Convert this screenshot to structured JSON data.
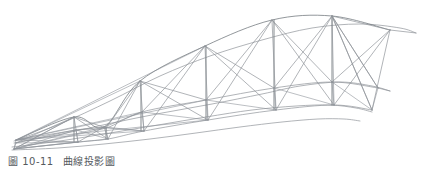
{
  "figure": {
    "caption_number": "圖 10-11",
    "caption_title": "曲線投影圖",
    "caption_full": "圖 10-11  曲線投影圖",
    "background_color": "#ffffff",
    "line_color": "#8f949a",
    "line_color_dark": "#6e747a",
    "caption_color": "#555a5e",
    "width": 424,
    "height": 170
  },
  "chart_data": {
    "type": "diagram",
    "title": "曲線投影圖",
    "subtitle": "",
    "xlabel": "",
    "ylabel": "",
    "grid": false,
    "legend": null,
    "xlim": [
      0,
      424
    ],
    "ylim": [
      0,
      170
    ],
    "curves": [
      {
        "name": "top-chord",
        "points": [
          [
            14,
            141
          ],
          [
            60,
            124
          ],
          [
            110,
            101
          ],
          [
            160,
            76
          ],
          [
            210,
            56
          ],
          [
            262,
            40
          ],
          [
            312,
            28
          ],
          [
            360,
            24
          ],
          [
            400,
            28
          ],
          [
            416,
            33
          ]
        ]
      },
      {
        "name": "middle-chord",
        "points": [
          [
            14,
            143
          ],
          [
            62,
            134
          ],
          [
            112,
            123
          ],
          [
            162,
            113
          ],
          [
            212,
            104
          ],
          [
            262,
            94
          ],
          [
            300,
            86
          ],
          [
            340,
            82
          ],
          [
            372,
            86
          ],
          [
            390,
            91
          ]
        ]
      },
      {
        "name": "lower-chord",
        "points": [
          [
            12,
            147
          ],
          [
            60,
            141
          ],
          [
            110,
            133
          ],
          [
            158,
            125
          ],
          [
            206,
            117
          ],
          [
            252,
            110
          ],
          [
            296,
            106
          ],
          [
            330,
            105
          ],
          [
            356,
            108
          ],
          [
            372,
            112
          ]
        ]
      },
      {
        "name": "bottom-chord",
        "points": [
          [
            12,
            150
          ],
          [
            58,
            148
          ],
          [
            104,
            144
          ],
          [
            150,
            139
          ],
          [
            196,
            133
          ],
          [
            240,
            127
          ],
          [
            282,
            122
          ],
          [
            318,
            119
          ],
          [
            344,
            119
          ],
          [
            360,
            121
          ]
        ]
      }
    ],
    "top_nodes": [
      {
        "id": "T0",
        "x": 16,
        "y": 140
      },
      {
        "id": "T1",
        "x": 74,
        "y": 117
      },
      {
        "id": "T2",
        "x": 104,
        "y": 127
      },
      {
        "id": "T3",
        "x": 140,
        "y": 81
      },
      {
        "id": "T4",
        "x": 205,
        "y": 46
      },
      {
        "id": "T5",
        "x": 272,
        "y": 20
      },
      {
        "id": "T6",
        "x": 332,
        "y": 16
      },
      {
        "id": "T7",
        "x": 390,
        "y": 30
      }
    ],
    "mid_nodes": [
      {
        "id": "M0",
        "x": 16,
        "y": 143
      },
      {
        "id": "M1",
        "x": 76,
        "y": 130
      },
      {
        "id": "M2",
        "x": 106,
        "y": 128
      },
      {
        "id": "M3",
        "x": 142,
        "y": 112
      },
      {
        "id": "M4",
        "x": 206,
        "y": 100
      },
      {
        "id": "M5",
        "x": 274,
        "y": 88
      },
      {
        "id": "M6",
        "x": 332,
        "y": 82
      },
      {
        "id": "M7",
        "x": 378,
        "y": 88
      }
    ],
    "bottom_nodes": [
      {
        "id": "B0",
        "x": 14,
        "y": 149
      },
      {
        "id": "B1",
        "x": 78,
        "y": 142
      },
      {
        "id": "B2",
        "x": 108,
        "y": 139
      },
      {
        "id": "B3",
        "x": 144,
        "y": 131
      },
      {
        "id": "B4",
        "x": 208,
        "y": 120
      },
      {
        "id": "B5",
        "x": 276,
        "y": 110
      },
      {
        "id": "B6",
        "x": 334,
        "y": 105
      },
      {
        "id": "B7",
        "x": 372,
        "y": 110
      }
    ],
    "vertical_posts": [
      {
        "x": 74,
        "y1": 117,
        "y2": 142
      },
      {
        "x": 106,
        "y1": 127,
        "y2": 139
      },
      {
        "x": 141,
        "y1": 81,
        "y2": 131
      },
      {
        "x": 206,
        "y1": 46,
        "y2": 120
      },
      {
        "x": 274,
        "y1": 20,
        "y2": 110
      },
      {
        "x": 332,
        "y1": 16,
        "y2": 105
      }
    ]
  }
}
